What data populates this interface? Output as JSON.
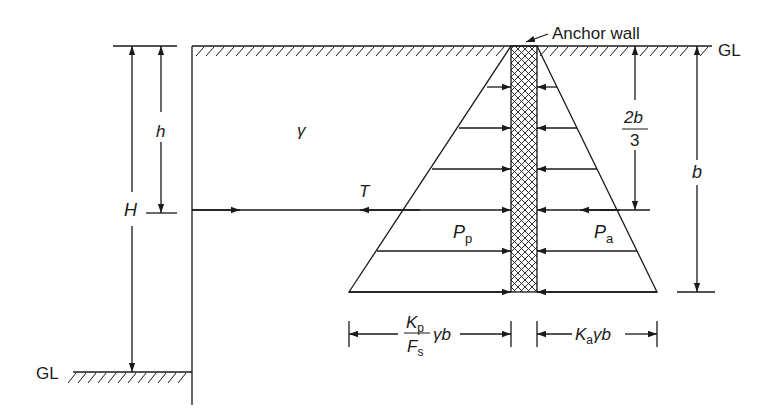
{
  "diagram": {
    "colors": {
      "line": "#1a1a1a",
      "background": "#ffffff"
    },
    "labels": {
      "anchor_wall": "Anchor wall",
      "gl_top": "GL",
      "gl_bottom": "GL",
      "gamma": "γ",
      "tension": "T",
      "H": "H",
      "h": "h",
      "b": "b",
      "two_b_over_three_num": "2b",
      "two_b_over_three_den": "3",
      "Pp_main": "P",
      "Pp_sub": "p",
      "Pa_main": "P",
      "Pa_sub": "a",
      "passive_width_num_main": "K",
      "passive_width_num_sub": "p",
      "passive_width_den_main": "F",
      "passive_width_den_sub": "s",
      "passive_width_tail": "γb",
      "active_width_main": "K",
      "active_width_sub": "a",
      "active_width_tail": "γb"
    }
  }
}
